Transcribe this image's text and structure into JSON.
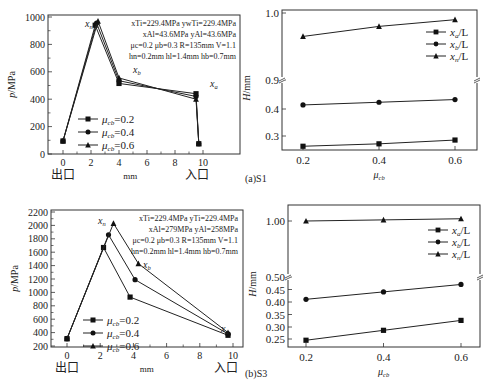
{
  "chart_data": [
    {
      "id": "a-left",
      "type": "line",
      "xlabel": "mm",
      "ylabel": "p/MPa",
      "xlim": [
        -1,
        11
      ],
      "ylim": [
        0,
        1000
      ],
      "xticks": [
        0,
        2,
        4,
        6,
        8,
        10
      ],
      "yticks": [
        0,
        200,
        400,
        600,
        800,
        1000
      ],
      "x_annotations": {
        "left": "出口",
        "right": "入口"
      },
      "point_labels": [
        "x_n",
        "x_b",
        "x_a"
      ],
      "info_lines": [
        "x_Ti=229.4MPa  yw_Ti=229.4MPa",
        "x_Al=43.6MPa  y_Al=43.6MPa",
        "μ_c=0.2  μ_b=0.3  R=135mm  V=1.1",
        "h_n=0.2mm  h_l=1.4mm  h_b=0.7mm"
      ],
      "legend": [
        "μ_cb=0.2",
        "μ_cb=0.4",
        "μ_cb=0.6"
      ],
      "series": [
        {
          "name": "μcb=0.2",
          "marker": "square",
          "x": [
            0,
            2.3,
            4.0,
            9.5,
            9.7
          ],
          "y": [
            95,
            940,
            515,
            440,
            75
          ]
        },
        {
          "name": "μcb=0.4",
          "marker": "circle",
          "x": [
            0,
            2.4,
            4.0,
            9.5,
            9.7
          ],
          "y": [
            95,
            955,
            535,
            420,
            75
          ]
        },
        {
          "name": "μcb=0.6",
          "marker": "triangle",
          "x": [
            0,
            2.5,
            4.0,
            9.5,
            9.7
          ],
          "y": [
            95,
            970,
            555,
            400,
            75
          ]
        }
      ]
    },
    {
      "id": "a-right",
      "type": "line",
      "caption": "(a)S1",
      "xlabel": "μ_cb",
      "ylabel": "H/mm",
      "xticks": [
        0.2,
        0.4,
        0.6
      ],
      "yticks": [
        "0.3",
        "0.4",
        "0.9",
        "1.0"
      ],
      "axis_break": true,
      "legend": [
        "x_a/L",
        "x_b/L",
        "x_n/L"
      ],
      "series": [
        {
          "name": "x_a/L",
          "marker": "square",
          "x": [
            0.2,
            0.4,
            0.6
          ],
          "y": [
            0.262,
            0.271,
            0.285
          ]
        },
        {
          "name": "x_b/L",
          "marker": "circle",
          "x": [
            0.2,
            0.4,
            0.6
          ],
          "y": [
            0.415,
            0.425,
            0.435
          ]
        },
        {
          "name": "x_n/L",
          "marker": "triangle",
          "x": [
            0.2,
            0.4,
            0.6
          ],
          "y": [
            0.965,
            0.98,
            0.99
          ]
        }
      ]
    },
    {
      "id": "b-left",
      "type": "line",
      "xlabel": "mm",
      "ylabel": "p/MPa",
      "xlim": [
        -1,
        11
      ],
      "ylim": [
        200,
        2200
      ],
      "xticks": [
        0,
        2,
        4,
        6,
        8,
        10
      ],
      "yticks": [
        200,
        400,
        600,
        800,
        1000,
        1200,
        1400,
        1600,
        1800,
        2000,
        2200
      ],
      "x_annotations": {
        "left": "出口",
        "right": "入口"
      },
      "point_labels": [
        "x_n",
        "x_b",
        "x_a"
      ],
      "info_lines": [
        "x_Ti=229.4MPa  y_Ti=229.4MPa",
        "x_Al=279MPa  y_Al=258MPa",
        "μ_c=0.2  μ_b=0.3  R=135mm  V=1.1",
        "h_n=0.2mm  h_l=1.4mm  h_b=0.7mm"
      ],
      "legend": [
        "μ_cb=0.2",
        "μ_cb=0.4",
        "μ_cb=0.6"
      ],
      "series": [
        {
          "name": "μcb=0.2",
          "marker": "square",
          "x": [
            0,
            2.2,
            3.8,
            9.7
          ],
          "y": [
            310,
            1670,
            930,
            360
          ]
        },
        {
          "name": "μcb=0.4",
          "marker": "circle",
          "x": [
            0,
            2.5,
            4.1,
            9.7
          ],
          "y": [
            310,
            1860,
            1190,
            380
          ]
        },
        {
          "name": "μcb=0.6",
          "marker": "triangle",
          "x": [
            0,
            2.8,
            4.3,
            9.7
          ],
          "y": [
            310,
            2030,
            1430,
            400
          ]
        }
      ]
    },
    {
      "id": "b-right",
      "type": "line",
      "caption": "(b)S3",
      "xlabel": "μ_cb",
      "ylabel": "H/mm",
      "xticks": [
        0.2,
        0.4,
        0.6
      ],
      "yticks": [
        "0.25",
        "0.30",
        "0.35",
        "0.40",
        "0.45",
        "0.50",
        "1.00"
      ],
      "axis_break": true,
      "legend": [
        "x_a/L",
        "x_b/L",
        "x_n/L"
      ],
      "series": [
        {
          "name": "x_a/L",
          "marker": "square",
          "x": [
            0.2,
            0.4,
            0.6
          ],
          "y": [
            0.245,
            0.285,
            0.325
          ]
        },
        {
          "name": "x_b/L",
          "marker": "circle",
          "x": [
            0.2,
            0.4,
            0.6
          ],
          "y": [
            0.41,
            0.44,
            0.47
          ]
        },
        {
          "name": "x_n/L",
          "marker": "triangle",
          "x": [
            0.2,
            0.4,
            0.6
          ],
          "y": [
            1.0,
            1.01,
            1.02
          ]
        }
      ]
    }
  ],
  "labels": {
    "mm": "mm",
    "exit": "出口",
    "entry": "入口",
    "caption_a": "(a)S1",
    "caption_b": "(b)S3",
    "ylabel_p": "p/MPa",
    "ylabel_h": "H/mm",
    "xlabel_mu": "μ",
    "xlabel_mu_sub": "cb"
  }
}
